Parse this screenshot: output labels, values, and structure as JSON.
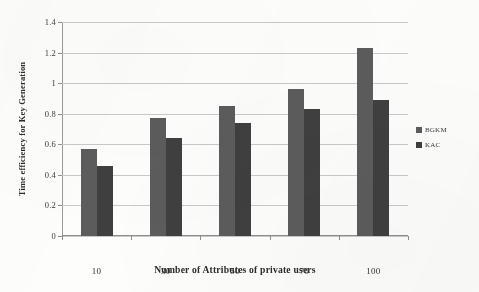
{
  "chart_data": {
    "type": "bar",
    "title": "",
    "xlabel": "Number of Attributes of private users",
    "ylabel": "Time efficiency for Key Generation",
    "categories": [
      "10",
      "30",
      "50",
      "70",
      "100"
    ],
    "series": [
      {
        "name": "BGKM",
        "color": "#5c5c5c",
        "values": [
          0.57,
          0.77,
          0.85,
          0.96,
          1.23
        ]
      },
      {
        "name": "KAC",
        "color": "#3f3f3f",
        "values": [
          0.46,
          0.64,
          0.74,
          0.83,
          0.89
        ]
      }
    ],
    "ylim": [
      0,
      1.4
    ],
    "yticks": [
      "0",
      "0.2",
      "0.4",
      "0.6",
      "0.8",
      "1",
      "1.2",
      "1.4"
    ],
    "ytick_values": [
      0,
      0.2,
      0.4,
      0.6,
      0.8,
      1,
      1.2,
      1.4
    ],
    "grid": true,
    "legend_position": "right"
  }
}
